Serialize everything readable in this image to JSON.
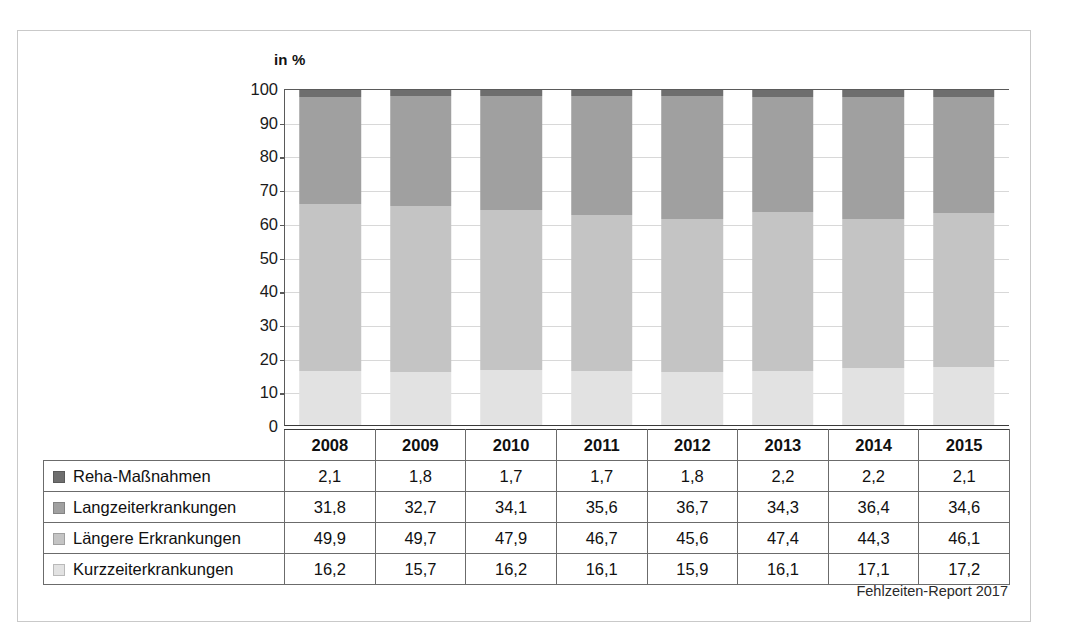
{
  "figure": {
    "unit_label": "in %",
    "source_note": "Fehlzeiten-Report 2017"
  },
  "colors": {
    "reha": "#6e6e6e",
    "langzeit": "#a0a0a0",
    "laengere": "#c4c4c4",
    "kurzzeit": "#e2e2e2",
    "axis": "#5a5a5a",
    "grid": "#d8d8d8",
    "frame": "#c9c9c9",
    "text": "#101010"
  },
  "axis": {
    "y_ticks": [
      "100",
      "90",
      "80",
      "70",
      "60",
      "50",
      "40",
      "30",
      "20",
      "10",
      "0"
    ],
    "y_min": 0,
    "y_max": 100,
    "y_step": 10
  },
  "table": {
    "row_label_header": "",
    "year_headers": [
      "2008",
      "2009",
      "2010",
      "2011",
      "2012",
      "2013",
      "2014",
      "2015"
    ],
    "rows": [
      {
        "label": "Reha-Maßnahmen",
        "color": "#6e6e6e",
        "values": [
          "2,1",
          "1,8",
          "1,7",
          "1,7",
          "1,8",
          "2,2",
          "2,2",
          "2,1"
        ]
      },
      {
        "label": "Langzeiterkrankungen",
        "color": "#a0a0a0",
        "values": [
          "31,8",
          "32,7",
          "34,1",
          "35,6",
          "36,7",
          "34,3",
          "36,4",
          "34,6"
        ]
      },
      {
        "label": "Längere Erkrankungen",
        "color": "#c4c4c4",
        "values": [
          "49,9",
          "49,7",
          "47,9",
          "46,7",
          "45,6",
          "47,4",
          "44,3",
          "46,1"
        ]
      },
      {
        "label": "Kurzzeiterkrankungen",
        "color": "#e2e2e2",
        "values": [
          "16,2",
          "15,7",
          "16,2",
          "16,1",
          "15,9",
          "16,1",
          "17,1",
          "17,2"
        ]
      }
    ]
  },
  "chart_data": {
    "type": "bar",
    "stacked": true,
    "stack_total": 100,
    "title": "",
    "subtitle": "",
    "xlabel": "",
    "ylabel": "in %",
    "ylim": [
      0,
      100
    ],
    "grid": true,
    "legend_position": "table-row-labels",
    "categories": [
      "2008",
      "2009",
      "2010",
      "2011",
      "2012",
      "2013",
      "2014",
      "2015"
    ],
    "series": [
      {
        "name": "Reha-Maßnahmen",
        "color": "#6e6e6e",
        "values": [
          2.1,
          1.8,
          1.7,
          1.7,
          1.8,
          2.2,
          2.2,
          2.1
        ]
      },
      {
        "name": "Langzeiterkrankungen",
        "color": "#a0a0a0",
        "values": [
          31.8,
          32.7,
          34.1,
          35.6,
          36.7,
          34.3,
          36.4,
          34.6
        ]
      },
      {
        "name": "Längere Erkrankungen",
        "color": "#c4c4c4",
        "values": [
          49.9,
          49.7,
          47.9,
          46.7,
          45.6,
          47.4,
          44.3,
          46.1
        ]
      },
      {
        "name": "Kurzzeiterkrankungen",
        "color": "#e2e2e2",
        "values": [
          16.2,
          15.7,
          16.2,
          16.1,
          15.9,
          16.1,
          17.1,
          17.2
        ]
      }
    ],
    "stack_order_top_to_bottom": [
      "Reha-Maßnahmen",
      "Langzeiterkrankungen",
      "Längere Erkrankungen",
      "Kurzzeiterkrankungen"
    ],
    "annotations": [
      "Fehlzeiten-Report 2017"
    ]
  }
}
